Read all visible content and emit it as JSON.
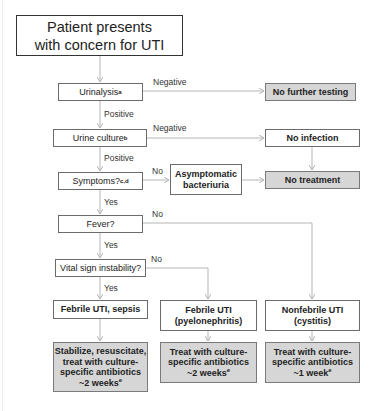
{
  "flowchart": {
    "title": "Patient presents with concern for UTI",
    "nodes": {
      "start": {
        "text": "Patient presents with concern for UTI"
      },
      "urinalysis": {
        "text": "Urinalysis",
        "sup": "a"
      },
      "no_further_testing": {
        "text": "No further testing"
      },
      "urine_culture": {
        "text": "Urine culture",
        "sup": "b"
      },
      "no_infection": {
        "text": "No infection"
      },
      "symptoms": {
        "text": "Symptoms?",
        "sup": "c,d"
      },
      "asymptomatic": {
        "line1": "Asymptomatic",
        "line2": "bacteriuria"
      },
      "no_treatment": {
        "text": "No treatment"
      },
      "fever": {
        "text": "Fever?"
      },
      "vital_sign": {
        "text": "Vital sign instability?"
      },
      "febrile_sepsis": {
        "text": "Febrile UTI, sepsis"
      },
      "febrile_pyelo": {
        "line1": "Febrile UTI",
        "line2": "(pyelonephritis)"
      },
      "nonfebrile": {
        "line1": "Nonfebrile UTI",
        "line2": "(cystitis)"
      },
      "treat_sepsis": {
        "line1": "Stabilize, resuscitate,",
        "line2": "treat with culture-",
        "line3": "specific antibiotics",
        "line4": "~2 weeks",
        "sup": "e"
      },
      "treat_pyelo": {
        "line1": "Treat with culture-",
        "line2": "specific antibiotics",
        "line3": "~2 weeks",
        "sup": "e"
      },
      "treat_cystitis": {
        "line1": "Treat with culture-",
        "line2": "specific antibiotics",
        "line3": "~1 week",
        "sup": "e"
      }
    },
    "edge_labels": {
      "urinalysis_negative": "Negative",
      "urinalysis_positive": "Positive",
      "culture_negative": "Negative",
      "culture_positive": "Positive",
      "symptoms_no": "No",
      "symptoms_yes": "Yes",
      "fever_no": "No",
      "fever_yes": "Yes",
      "vital_no": "No",
      "vital_yes": "Yes"
    },
    "colors": {
      "line": "#b5b5b5",
      "box_border": "#6b6b6b",
      "gray_fill": "#d6d6d6"
    }
  }
}
